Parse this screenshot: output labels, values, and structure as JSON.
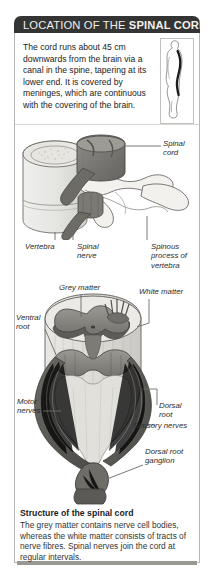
{
  "header": {
    "title_plain": "LOCATION OF THE ",
    "title_bold": "SPINAL CORD",
    "title_full": "LOCATION OF THE SPINAL CORD",
    "bar_color": "#343434",
    "text_color": "#f2f0ec"
  },
  "intro": {
    "text": "The cord runs about 45 cm downwards from the brain via a canal in the spine, tapering at its lower end. It is covered by meninges, which are continuous with the covering of the brain."
  },
  "figure_body": {
    "name": "human-body-profile-with-spinal-cord",
    "description": "Side view silhouette of a human body with the spinal cord shown as a dark curved line"
  },
  "diagram_vertebra": {
    "name": "vertebra-and-spinal-cord-diagram",
    "labels": [
      {
        "key": "spinal_cord",
        "text": "Spinal cord"
      },
      {
        "key": "vertebra",
        "text": "Vertebra"
      },
      {
        "key": "spinal_nerve",
        "text": "Spinal\nnerve"
      },
      {
        "key": "spinous_process",
        "text": "Spinous\nprocess of\nvertebra"
      }
    ]
  },
  "diagram_cord": {
    "name": "spinal-cord-cross-section-diagram",
    "labels": [
      {
        "key": "grey_matter",
        "text": "Grey matter"
      },
      {
        "key": "white_matter",
        "text": "White matter"
      },
      {
        "key": "ventral_root",
        "text": "Ventral\nroot"
      },
      {
        "key": "motor_nerves",
        "text": "Motor\nnerves"
      },
      {
        "key": "dorsal_root",
        "text": "Dorsal\nroot"
      },
      {
        "key": "sensory_nerves",
        "text": "Sensory nerves"
      },
      {
        "key": "dorsal_root_ganglion",
        "text": "Dorsal root\nganglion"
      }
    ]
  },
  "caption": {
    "title": "Structure of the spinal cord",
    "body": "The grey matter contains nerve cell bodies, whereas the white matter consists of tracts of nerve fibres. Spinal nerves join the cord at regular intervals."
  },
  "colors": {
    "header_bar": "#343434",
    "panel_border": "#b9b7b3",
    "footer_bar": "#9a9893",
    "bone_light": "#ececea",
    "grey_matter": "#8e8c88",
    "nerve_dark": "#5d5b58",
    "text": "#222222"
  }
}
